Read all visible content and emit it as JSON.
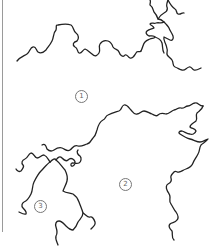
{
  "diagram": {
    "type": "coastline-outline-map",
    "stroke_color": "#222222",
    "background": "#ffffff",
    "regions": [
      {
        "id": "region-1",
        "label": "①",
        "number": "1",
        "x": 80,
        "y": 95
      },
      {
        "id": "region-2",
        "label": "②",
        "number": "2",
        "x": 124,
        "y": 183
      },
      {
        "id": "region-3",
        "label": "③",
        "number": "3",
        "x": 39,
        "y": 205
      }
    ]
  }
}
